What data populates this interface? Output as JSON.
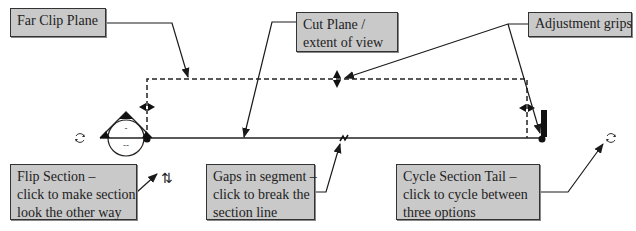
{
  "callouts": {
    "far_clip": {
      "lines": [
        "Far Clip Plane"
      ]
    },
    "cut_plane": {
      "lines": [
        "Cut Plane /",
        "extent of view"
      ]
    },
    "adjust": {
      "lines": [
        "Adjustment grips"
      ]
    },
    "flip": {
      "lines": [
        "Flip Section –",
        "click to make section",
        "look the other way"
      ]
    },
    "gaps": {
      "lines": [
        "Gaps in segment –",
        "click to break the",
        "section line"
      ]
    },
    "cycle_tail": {
      "lines": [
        "Cycle Section Tail –",
        "click to cycle between",
        "three options"
      ]
    }
  },
  "symbols": {
    "section_head_top": "-",
    "section_head_bottom": "--",
    "flip_icon": "⇅"
  },
  "colors": {
    "callout_fill": "#c9c9c9",
    "callout_border": "#333333",
    "line": "#1a1a1a",
    "grip": "#111111"
  }
}
